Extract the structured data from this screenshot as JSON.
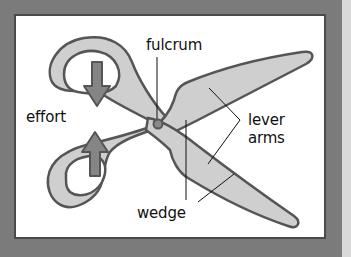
{
  "diagram": {
    "labels": {
      "fulcrum": "fulcrum",
      "effort": "effort",
      "lever_line1": "lever",
      "lever_line2": "arms",
      "wedge": "wedge"
    },
    "colors": {
      "background": "#7b7b7b",
      "panel": "#ffffff",
      "panel_border": "#4a4a4a",
      "scissor_fill": "#cfcfcf",
      "scissor_outline": "#555555",
      "arrow_fill": "#858585",
      "pivot_fill": "#8a8a8a",
      "leader_line": "#111111",
      "side_strip": "#d9d9d9"
    },
    "icons": [
      "down-arrow-icon",
      "up-arrow-icon",
      "pivot-icon"
    ]
  }
}
